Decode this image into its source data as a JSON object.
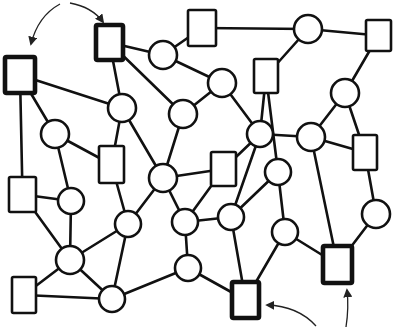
{
  "diagram": {
    "title": "Hand-drawn network graph with highlighted square nodes",
    "colors": {
      "stroke": "#111111",
      "background": "#ffffff"
    },
    "nodes": [
      {
        "id": "S1",
        "shape": "square",
        "x": 5,
        "y": 57,
        "w": 30,
        "h": 36,
        "bold": true
      },
      {
        "id": "S2",
        "shape": "square",
        "x": 96,
        "y": 25,
        "w": 27,
        "h": 35,
        "bold": true
      },
      {
        "id": "S3",
        "shape": "square",
        "x": 188,
        "y": 10,
        "w": 28,
        "h": 36,
        "bold": false
      },
      {
        "id": "S4",
        "shape": "square",
        "x": 366,
        "y": 20,
        "w": 25,
        "h": 31,
        "bold": false
      },
      {
        "id": "S5",
        "shape": "square",
        "x": 254,
        "y": 59,
        "w": 24,
        "h": 34,
        "bold": false
      },
      {
        "id": "S6",
        "shape": "square",
        "x": 99,
        "y": 146,
        "w": 25,
        "h": 37,
        "bold": false
      },
      {
        "id": "S7",
        "shape": "square",
        "x": 211,
        "y": 152,
        "w": 25,
        "h": 34,
        "bold": false
      },
      {
        "id": "S8",
        "shape": "square",
        "x": 353,
        "y": 135,
        "w": 24,
        "h": 35,
        "bold": false
      },
      {
        "id": "S9",
        "shape": "square",
        "x": 9,
        "y": 177,
        "w": 27,
        "h": 35,
        "bold": false
      },
      {
        "id": "S10",
        "shape": "square",
        "x": 12,
        "y": 277,
        "w": 24,
        "h": 36,
        "bold": false
      },
      {
        "id": "S11",
        "shape": "square",
        "x": 232,
        "y": 282,
        "w": 27,
        "h": 36,
        "bold": true
      },
      {
        "id": "S12",
        "shape": "square",
        "x": 323,
        "y": 246,
        "w": 29,
        "h": 37,
        "bold": true
      },
      {
        "id": "C1",
        "shape": "circle",
        "cx": 163,
        "cy": 55,
        "r": 14
      },
      {
        "id": "C2",
        "shape": "circle",
        "cx": 308,
        "cy": 29,
        "r": 14
      },
      {
        "id": "C3",
        "shape": "circle",
        "cx": 122,
        "cy": 108,
        "r": 14
      },
      {
        "id": "C4",
        "shape": "circle",
        "cx": 222,
        "cy": 83,
        "r": 14
      },
      {
        "id": "C5",
        "shape": "circle",
        "cx": 183,
        "cy": 114,
        "r": 14
      },
      {
        "id": "C6",
        "shape": "circle",
        "cx": 55,
        "cy": 134,
        "r": 14
      },
      {
        "id": "C7",
        "shape": "circle",
        "cx": 345,
        "cy": 93,
        "r": 14
      },
      {
        "id": "C8",
        "shape": "circle",
        "cx": 260,
        "cy": 134,
        "r": 13
      },
      {
        "id": "C9",
        "shape": "circle",
        "cx": 311,
        "cy": 137,
        "r": 14
      },
      {
        "id": "C10",
        "shape": "circle",
        "cx": 163,
        "cy": 178,
        "r": 14
      },
      {
        "id": "C11",
        "shape": "circle",
        "cx": 278,
        "cy": 172,
        "r": 13
      },
      {
        "id": "C12",
        "shape": "circle",
        "cx": 71,
        "cy": 201,
        "r": 13
      },
      {
        "id": "C13",
        "shape": "circle",
        "cx": 128,
        "cy": 224,
        "r": 13
      },
      {
        "id": "C14",
        "shape": "circle",
        "cx": 185,
        "cy": 222,
        "r": 13
      },
      {
        "id": "C15",
        "shape": "circle",
        "cx": 231,
        "cy": 217,
        "r": 13
      },
      {
        "id": "C16",
        "shape": "circle",
        "cx": 376,
        "cy": 214,
        "r": 14
      },
      {
        "id": "C17",
        "shape": "circle",
        "cx": 285,
        "cy": 232,
        "r": 13
      },
      {
        "id": "C18",
        "shape": "circle",
        "cx": 70,
        "cy": 260,
        "r": 14
      },
      {
        "id": "C19",
        "shape": "circle",
        "cx": 188,
        "cy": 268,
        "r": 13
      },
      {
        "id": "C20",
        "shape": "circle",
        "cx": 112,
        "cy": 299,
        "r": 13
      }
    ],
    "edges": [
      [
        "S1",
        "C3"
      ],
      [
        "S1",
        "C6"
      ],
      [
        "S1",
        "S9"
      ],
      [
        "S2",
        "C1"
      ],
      [
        "S2",
        "C3"
      ],
      [
        "S2",
        "C5"
      ],
      [
        "S3",
        "C1"
      ],
      [
        "S3",
        "C2"
      ],
      [
        "C1",
        "C4"
      ],
      [
        "C2",
        "S4"
      ],
      [
        "C2",
        "S5"
      ],
      [
        "S4",
        "C7"
      ],
      [
        "S5",
        "C8"
      ],
      [
        "S5",
        "C11"
      ],
      [
        "C4",
        "C5"
      ],
      [
        "C4",
        "C8"
      ],
      [
        "C3",
        "S6"
      ],
      [
        "C3",
        "C10"
      ],
      [
        "C5",
        "C10"
      ],
      [
        "C6",
        "S6"
      ],
      [
        "C6",
        "C12"
      ],
      [
        "C7",
        "C9"
      ],
      [
        "C7",
        "S8"
      ],
      [
        "C8",
        "C9"
      ],
      [
        "C8",
        "S7"
      ],
      [
        "C8",
        "C15"
      ],
      [
        "C9",
        "S8"
      ],
      [
        "C9",
        "S12"
      ],
      [
        "S6",
        "C13"
      ],
      [
        "C10",
        "S7"
      ],
      [
        "C10",
        "C13"
      ],
      [
        "C10",
        "C14"
      ],
      [
        "S7",
        "C14"
      ],
      [
        "S8",
        "C16"
      ],
      [
        "C11",
        "C15"
      ],
      [
        "C11",
        "C17"
      ],
      [
        "S9",
        "C12"
      ],
      [
        "S9",
        "C18"
      ],
      [
        "C12",
        "C18"
      ],
      [
        "C13",
        "C18"
      ],
      [
        "C13",
        "C20"
      ],
      [
        "C14",
        "C19"
      ],
      [
        "C15",
        "S11"
      ],
      [
        "C15",
        "C14"
      ],
      [
        "C16",
        "S12"
      ],
      [
        "C17",
        "S11"
      ],
      [
        "C17",
        "S12"
      ],
      [
        "C18",
        "S10"
      ],
      [
        "C18",
        "C20"
      ],
      [
        "S10",
        "C20"
      ],
      [
        "C20",
        "C19"
      ],
      [
        "C19",
        "S11"
      ]
    ],
    "annotations": [
      {
        "id": "arrow-top",
        "description": "curved double arrow between top-left bold squares",
        "from": "S1",
        "to": "S2"
      },
      {
        "id": "arrow-bottom",
        "description": "curved arrows from bottom pointing to bottom bold squares",
        "targets": [
          "S11",
          "S12"
        ]
      }
    ]
  }
}
